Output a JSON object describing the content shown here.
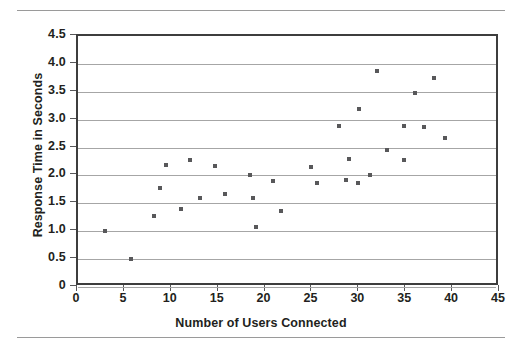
{
  "chart_data": {
    "type": "scatter",
    "title": "",
    "xlabel": "Number of Users Connected",
    "ylabel": "Response Time in Seconds",
    "xlim": [
      0,
      45
    ],
    "ylim": [
      0,
      4.5
    ],
    "xticks": [
      "0",
      "5",
      "10",
      "15",
      "20",
      "25",
      "30",
      "35",
      "40",
      "45"
    ],
    "xtick_values": [
      0,
      5,
      10,
      15,
      20,
      25,
      30,
      35,
      40,
      45
    ],
    "yticks": [
      "0",
      "0.5",
      "1.0",
      "1.5",
      "2.0",
      "2.5",
      "3.0",
      "3.5",
      "4.0",
      "4.5"
    ],
    "ytick_values": [
      0,
      0.5,
      1.0,
      1.5,
      2.0,
      2.5,
      3.0,
      3.5,
      4.0,
      4.5
    ],
    "grid": "horizontal",
    "legend": "none",
    "marker": "square",
    "marker_color": "#58585a",
    "points": [
      {
        "x": 2.9,
        "y": 1.0
      },
      {
        "x": 5.7,
        "y": 0.5
      },
      {
        "x": 8.1,
        "y": 1.28
      },
      {
        "x": 8.7,
        "y": 1.78
      },
      {
        "x": 9.4,
        "y": 2.18
      },
      {
        "x": 11.0,
        "y": 1.39
      },
      {
        "x": 11.9,
        "y": 2.27
      },
      {
        "x": 13.0,
        "y": 1.6
      },
      {
        "x": 14.6,
        "y": 2.17
      },
      {
        "x": 15.7,
        "y": 1.66
      },
      {
        "x": 18.3,
        "y": 2.0
      },
      {
        "x": 18.7,
        "y": 1.59
      },
      {
        "x": 19.0,
        "y": 1.08
      },
      {
        "x": 20.8,
        "y": 1.9
      },
      {
        "x": 21.7,
        "y": 1.37
      },
      {
        "x": 24.8,
        "y": 2.16
      },
      {
        "x": 25.5,
        "y": 1.87
      },
      {
        "x": 27.8,
        "y": 2.88
      },
      {
        "x": 28.6,
        "y": 1.91
      },
      {
        "x": 28.9,
        "y": 2.29
      },
      {
        "x": 29.9,
        "y": 1.87
      },
      {
        "x": 30.0,
        "y": 3.19
      },
      {
        "x": 31.1,
        "y": 2.0
      },
      {
        "x": 31.9,
        "y": 3.88
      },
      {
        "x": 32.9,
        "y": 2.46
      },
      {
        "x": 34.8,
        "y": 2.27
      },
      {
        "x": 34.8,
        "y": 2.88
      },
      {
        "x": 35.9,
        "y": 3.47
      },
      {
        "x": 36.9,
        "y": 2.87
      },
      {
        "x": 38.0,
        "y": 3.75
      },
      {
        "x": 39.1,
        "y": 2.67
      }
    ]
  }
}
